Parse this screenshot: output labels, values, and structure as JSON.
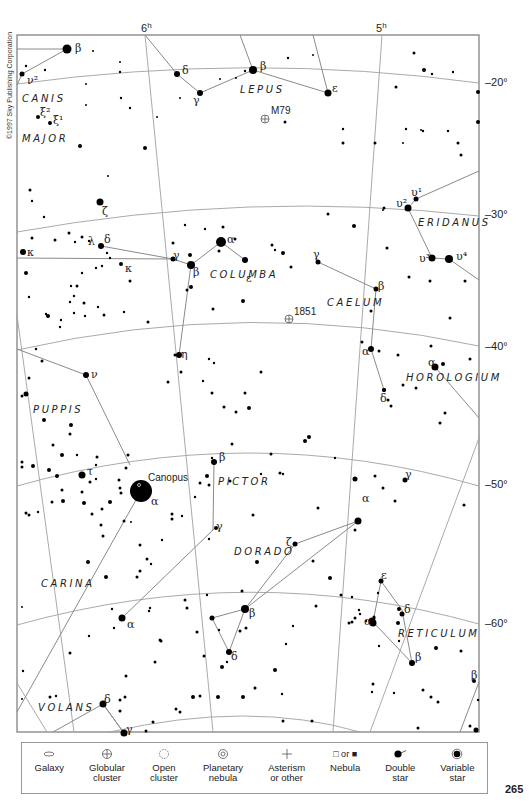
{
  "page": {
    "number": "265",
    "copyright": "©1997 Sky Publishing Corporation"
  },
  "chart_data": {
    "type": "star_chart",
    "title": "",
    "ra_labels": [
      {
        "text": "6h",
        "x": 147,
        "y": 30
      },
      {
        "text": "5h",
        "x": 381,
        "y": 30
      }
    ],
    "dec_labels": [
      {
        "text": "–20°",
        "x": 485,
        "y": 86
      },
      {
        "text": "–30°",
        "x": 485,
        "y": 218
      },
      {
        "text": "–40°",
        "x": 485,
        "y": 350
      },
      {
        "text": "–50°",
        "x": 485,
        "y": 488
      },
      {
        "text": "–60°",
        "x": 485,
        "y": 627
      }
    ],
    "constellations": [
      {
        "name": "CANIS",
        "x": 22,
        "y": 102
      },
      {
        "name": "MAJOR",
        "x": 22,
        "y": 142
      },
      {
        "name": "LEPUS",
        "x": 240,
        "y": 93
      },
      {
        "name": "ERIDANUS",
        "x": 418,
        "y": 226
      },
      {
        "name": "COLUMBA",
        "x": 210,
        "y": 278
      },
      {
        "name": "CAELUM",
        "x": 327,
        "y": 306
      },
      {
        "name": "HOROLOGIUM",
        "x": 406,
        "y": 381
      },
      {
        "name": "PUPPIS",
        "x": 33,
        "y": 413
      },
      {
        "name": "PICTOR",
        "x": 218,
        "y": 485
      },
      {
        "name": "DORADO",
        "x": 234,
        "y": 555
      },
      {
        "name": "CARINA",
        "x": 41,
        "y": 587
      },
      {
        "name": "RETICULUM",
        "x": 398,
        "y": 637
      },
      {
        "name": "VOLANS",
        "x": 38,
        "y": 711
      }
    ],
    "deep_sky_objects": [
      {
        "name": "M79",
        "type": "globular_cluster",
        "x": 265,
        "y": 119
      },
      {
        "name": "1851",
        "type": "globular_cluster",
        "x": 289,
        "y": 319
      }
    ],
    "named_stars": [
      {
        "name": "Canopus",
        "designation": "α Carinae",
        "x": 141,
        "y": 491,
        "r": 11
      }
    ],
    "star_labels": [
      {
        "t": "β",
        "x": 75,
        "y": 52
      },
      {
        "t": "ν²",
        "x": 27,
        "y": 84
      },
      {
        "t": "ξ²",
        "x": 40,
        "y": 116
      },
      {
        "t": "ξ¹",
        "x": 53,
        "y": 124
      },
      {
        "t": "δ",
        "x": 182,
        "y": 74
      },
      {
        "t": "β",
        "x": 260,
        "y": 70
      },
      {
        "t": "γ",
        "x": 193,
        "y": 104
      },
      {
        "t": "ε",
        "x": 332,
        "y": 92
      },
      {
        "t": "ζ",
        "x": 102,
        "y": 215
      },
      {
        "t": "λ",
        "x": 88,
        "y": 245
      },
      {
        "t": "δ",
        "x": 104,
        "y": 243
      },
      {
        "t": "κ",
        "x": 27,
        "y": 256
      },
      {
        "t": "κ",
        "x": 125,
        "y": 272
      },
      {
        "t": "γ",
        "x": 173,
        "y": 259
      },
      {
        "t": "α",
        "x": 227,
        "y": 243
      },
      {
        "t": "β",
        "x": 193,
        "y": 276
      },
      {
        "t": "ε",
        "x": 246,
        "y": 282
      },
      {
        "t": "γ",
        "x": 313,
        "y": 258
      },
      {
        "t": "υ¹",
        "x": 411,
        "y": 196
      },
      {
        "t": "υ²",
        "x": 396,
        "y": 207
      },
      {
        "t": "υ³",
        "x": 419,
        "y": 262
      },
      {
        "t": "υ⁴",
        "x": 456,
        "y": 260
      },
      {
        "t": "β",
        "x": 378,
        "y": 290
      },
      {
        "t": "α",
        "x": 362,
        "y": 355
      },
      {
        "t": "α",
        "x": 428,
        "y": 366
      },
      {
        "t": "δ",
        "x": 380,
        "y": 402
      },
      {
        "t": "η",
        "x": 181,
        "y": 358
      },
      {
        "t": "ν",
        "x": 91,
        "y": 378
      },
      {
        "t": "τ",
        "x": 87,
        "y": 475
      },
      {
        "t": "α",
        "x": 151,
        "y": 505
      },
      {
        "t": "β",
        "x": 219,
        "y": 461
      },
      {
        "t": "γ",
        "x": 216,
        "y": 530
      },
      {
        "t": "γ",
        "x": 405,
        "y": 478
      },
      {
        "t": "α",
        "x": 362,
        "y": 502
      },
      {
        "t": "ζ",
        "x": 286,
        "y": 546
      },
      {
        "t": "α",
        "x": 127,
        "y": 628
      },
      {
        "t": "β",
        "x": 249,
        "y": 617
      },
      {
        "t": "δ",
        "x": 231,
        "y": 660
      },
      {
        "t": "ε",
        "x": 381,
        "y": 579
      },
      {
        "t": "δ",
        "x": 404,
        "y": 613
      },
      {
        "t": "α",
        "x": 364,
        "y": 625
      },
      {
        "t": "β",
        "x": 415,
        "y": 661
      },
      {
        "t": "β",
        "x": 471,
        "y": 679
      },
      {
        "t": "δ",
        "x": 104,
        "y": 703
      },
      {
        "t": "γ",
        "x": 126,
        "y": 733
      }
    ]
  },
  "legend": {
    "items": [
      {
        "label1": "Galaxy",
        "label2": "",
        "icon": "galaxy-icon"
      },
      {
        "label1": "Globular",
        "label2": "cluster",
        "icon": "globular-cluster-icon"
      },
      {
        "label1": "Open",
        "label2": "cluster",
        "icon": "open-cluster-icon"
      },
      {
        "label1": "Planetary",
        "label2": "nebula",
        "icon": "planetary-nebula-icon"
      },
      {
        "label1": "Asterism",
        "label2": "or other",
        "icon": "asterism-icon"
      },
      {
        "label1": "Nebula",
        "label2": "",
        "icon": "nebula-icon",
        "pre": "□ or ■"
      },
      {
        "label1": "Double",
        "label2": "star",
        "icon": "double-star-icon"
      },
      {
        "label1": "Variable",
        "label2": "star",
        "icon": "variable-star-icon"
      }
    ]
  },
  "colors": {
    "grid": "#9a9a9a",
    "figure": "#8a8a8a",
    "star": "#000000",
    "border": "#777777"
  }
}
